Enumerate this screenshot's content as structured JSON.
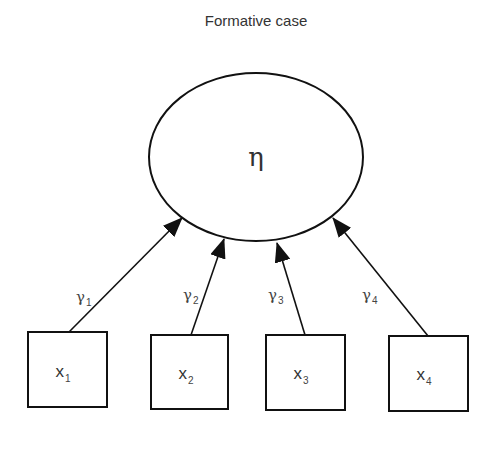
{
  "title": "Formative case",
  "latent": {
    "symbol": "η"
  },
  "paths": [
    {
      "symbol": "γ",
      "sub": "1"
    },
    {
      "symbol": "γ",
      "sub": "2"
    },
    {
      "symbol": "γ",
      "sub": "3"
    },
    {
      "symbol": "γ",
      "sub": "4"
    }
  ],
  "indicators": [
    {
      "symbol": "x",
      "sub": "1"
    },
    {
      "symbol": "x",
      "sub": "2"
    },
    {
      "symbol": "x",
      "sub": "3"
    },
    {
      "symbol": "x",
      "sub": "4"
    }
  ]
}
